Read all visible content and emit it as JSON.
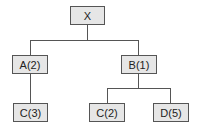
{
  "diagram": {
    "type": "tree",
    "nodes": [
      {
        "id": "x",
        "label": "X"
      },
      {
        "id": "a",
        "label": "A(2)"
      },
      {
        "id": "b",
        "label": "B(1)"
      },
      {
        "id": "c3",
        "label": "C(3)"
      },
      {
        "id": "c2",
        "label": "C(2)"
      },
      {
        "id": "d5",
        "label": "D(5)"
      }
    ],
    "edges": [
      {
        "from": "X",
        "to": "A(2)"
      },
      {
        "from": "X",
        "to": "B(1)"
      },
      {
        "from": "A(2)",
        "to": "C(3)"
      },
      {
        "from": "B(1)",
        "to": "C(2)"
      },
      {
        "from": "B(1)",
        "to": "D(5)"
      }
    ],
    "colors": {
      "node_fill": "#e6e6e6",
      "border": "#555555",
      "text": "#222222"
    }
  }
}
